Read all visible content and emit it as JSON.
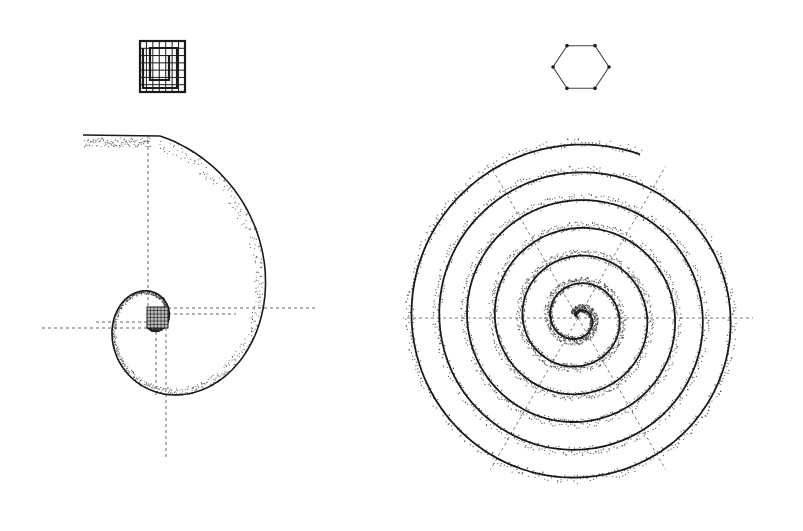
{
  "figure": {
    "background": "#ffffff",
    "ink_color": "#1a1a1a",
    "stipple_color": "#2a2a2a",
    "guide_color": "#555555"
  },
  "left_panel": {
    "name": "logarithmic-spiral",
    "icon": "square-grid-icon",
    "icon_box": {
      "x": 140,
      "y": 41,
      "w": 45,
      "h": 51,
      "cells": 7
    },
    "center": {
      "x": 155,
      "y": 318
    },
    "spiral": {
      "type": "logarithmic",
      "turns": 2.6,
      "outer_radius": 165,
      "tail_start": {
        "x": 83,
        "y": 135
      }
    },
    "center_grid": {
      "x": 147,
      "y": 307,
      "w": 21,
      "h": 21,
      "cells": 6
    },
    "guides": "dashed orthogonal"
  },
  "right_panel": {
    "name": "archimedean-spiral",
    "icon": "hexagon-icon",
    "icon_center": {
      "x": 581,
      "y": 67
    },
    "icon_radius": 28,
    "center": {
      "x": 578,
      "y": 318
    },
    "spiral": {
      "type": "archimedean",
      "turns": 6.3,
      "outer_radius": 175
    },
    "guides": "dashed radial at 60 degrees"
  }
}
